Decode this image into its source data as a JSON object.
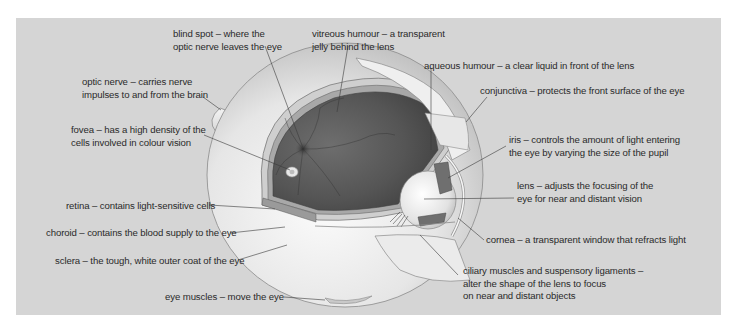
{
  "figure": {
    "background_color": "#d5d5d5"
  },
  "labels": {
    "blind_spot": {
      "lines": [
        "blind spot – where the",
        "optic nerve leaves the eye"
      ]
    },
    "vitreous_humour": {
      "lines": [
        "vitreous humour – a transparent",
        "jelly behind the lens"
      ]
    },
    "optic_nerve": {
      "lines": [
        "optic nerve – carries nerve",
        "impulses to and from the brain"
      ]
    },
    "aqueous_humour": {
      "lines": [
        "aqueous humour – a clear liquid in front of the lens"
      ]
    },
    "conjunctiva": {
      "lines": [
        "conjunctiva – protects the front surface of the eye"
      ]
    },
    "fovea": {
      "lines": [
        "fovea – has a high density of the",
        "cells involved in colour vision"
      ]
    },
    "iris": {
      "lines": [
        "iris – controls the amount of light entering",
        "the eye by varying the size of the pupil"
      ]
    },
    "lens": {
      "lines": [
        "lens – adjusts the focusing of the",
        "eye for near and distant vision"
      ]
    },
    "retina": {
      "lines": [
        "retina – contains light-sensitive cells"
      ]
    },
    "choroid": {
      "lines": [
        "choroid – contains the blood supply to the eye"
      ]
    },
    "cornea": {
      "lines": [
        "cornea – a transparent window that refracts light"
      ]
    },
    "sclera": {
      "lines": [
        "sclera – the tough, white outer coat of the eye"
      ]
    },
    "ciliary": {
      "lines": [
        "ciliary muscles and suspensory ligaments –",
        "alter the shape of the lens to focus",
        "on near and distant objects"
      ]
    },
    "eye_muscles": {
      "lines": [
        "eye muscles – move the eye"
      ]
    }
  }
}
